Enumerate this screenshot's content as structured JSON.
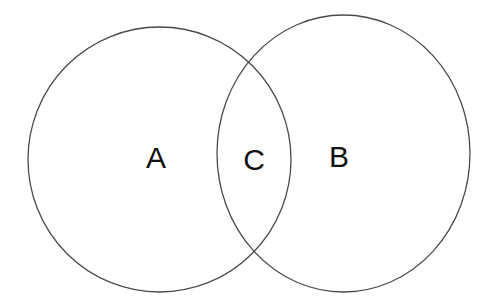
{
  "diagram": {
    "type": "venn",
    "background_color": "#ffffff",
    "stroke_color": "#4a4a4a",
    "label_color": "#111111",
    "sets": [
      {
        "id": "A",
        "cx": 159.5,
        "cy": 159.5,
        "rx": 131.5,
        "ry": 132.5
      },
      {
        "id": "B",
        "cx": 343.5,
        "cy": 153.5,
        "rx": 126.5,
        "ry": 138.5
      }
    ],
    "labels": {
      "a": {
        "text": "A",
        "x": 156,
        "y": 168
      },
      "c": {
        "text": "C",
        "x": 254,
        "y": 170
      },
      "b": {
        "text": "B",
        "x": 339,
        "y": 167
      }
    },
    "regions": [
      {
        "label": "A",
        "description": "only in left set"
      },
      {
        "label": "C",
        "description": "intersection of both sets"
      },
      {
        "label": "B",
        "description": "only in right set"
      }
    ]
  }
}
